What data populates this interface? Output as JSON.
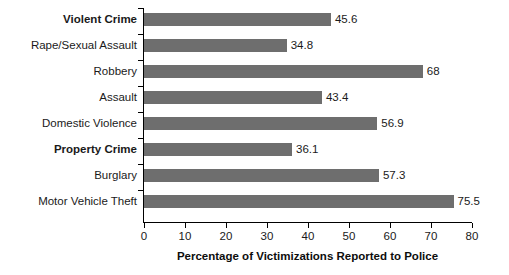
{
  "chart_data": {
    "type": "bar",
    "orientation": "horizontal",
    "title": "",
    "xlabel": "Percentage of Victimizations Reported to Police",
    "ylabel": "",
    "xlim": [
      0,
      80
    ],
    "xticks": [
      0,
      10,
      20,
      30,
      40,
      50,
      60,
      70,
      80
    ],
    "xtick_labels": [
      "0",
      "10",
      "20",
      "30",
      "40",
      "50",
      "60",
      "70",
      "80"
    ],
    "grid": false,
    "legend": false,
    "bar_color": "#6e6e6e",
    "axis_color": "#000000",
    "text_color": "#1a1a1a",
    "categories": [
      "Violent Crime",
      "Rape/Sexual Assault",
      "Robbery",
      "Assault",
      "Domestic Violence",
      "Property Crime",
      "Burglary",
      "Motor Vehicle Theft"
    ],
    "values": [
      45.6,
      34.8,
      68,
      43.4,
      56.9,
      36.1,
      57.3,
      75.5
    ],
    "value_labels": [
      "45.6",
      "34.8",
      "68",
      "43.4",
      "56.9",
      "36.1",
      "57.3",
      "75.5"
    ],
    "bold_categories": [
      "Violent Crime",
      "Property Crime"
    ],
    "bars": [
      {
        "label": "Violent Crime",
        "value": 45.6,
        "value_label": "45.6",
        "bold": true
      },
      {
        "label": "Rape/Sexual Assault",
        "value": 34.8,
        "value_label": "34.8",
        "bold": false
      },
      {
        "label": "Robbery",
        "value": 68,
        "value_label": "68",
        "bold": false
      },
      {
        "label": "Assault",
        "value": 43.4,
        "value_label": "43.4",
        "bold": false
      },
      {
        "label": "Domestic Violence",
        "value": 56.9,
        "value_label": "56.9",
        "bold": false
      },
      {
        "label": "Property Crime",
        "value": 36.1,
        "value_label": "36.1",
        "bold": true
      },
      {
        "label": "Burglary",
        "value": 57.3,
        "value_label": "57.3",
        "bold": false
      },
      {
        "label": "Motor Vehicle Theft",
        "value": 75.5,
        "value_label": "75.5",
        "bold": false
      }
    ]
  }
}
